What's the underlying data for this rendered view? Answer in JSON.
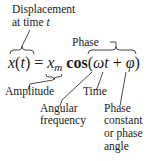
{
  "equation": {
    "lhs_var": "x",
    "lhs_arg": "t",
    "equals": "=",
    "amp_var": "x",
    "amp_sub": "m",
    "func": "cos",
    "omega": "ω",
    "t": "t",
    "plus": "+",
    "phi": "φ"
  },
  "labels": {
    "displacement_line1": "Displacement",
    "displacement_line2_prefix": "at time ",
    "displacement_line2_var": "t",
    "phase": "Phase",
    "amplitude": "Amplitude",
    "time": "Time",
    "angular_line1": "Angular",
    "angular_line2": "frequency",
    "phase_const_line1": "Phase",
    "phase_const_line2": "constant",
    "phase_const_line3": "or phase",
    "phase_const_line4": "angle"
  }
}
